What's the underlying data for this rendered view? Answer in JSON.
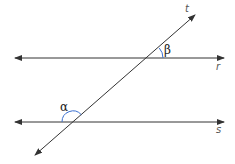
{
  "diagram": {
    "lines": [
      {
        "name": "r",
        "label": "r",
        "y": 58
      },
      {
        "name": "s",
        "label": "s",
        "y": 122
      },
      {
        "name": "t",
        "label": "t"
      }
    ],
    "angles": [
      {
        "name": "beta",
        "label": "β",
        "at": "r∩t",
        "color": "#3a6fd0"
      },
      {
        "name": "alpha",
        "label": "α",
        "at": "s∩t",
        "color": "#3a6fd0"
      }
    ],
    "colors": {
      "line": "#333333",
      "arc": "#3a6fd0"
    }
  }
}
